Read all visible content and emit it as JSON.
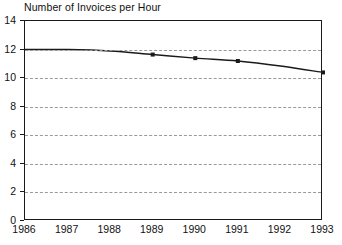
{
  "chart_data": {
    "type": "line",
    "title": "Number of Invoices per Hour",
    "xlabel": "",
    "ylabel": "",
    "categories": [
      "1986",
      "1987",
      "1988",
      "1989",
      "1990",
      "1991",
      "1992",
      "1993"
    ],
    "x": [
      1986,
      1987,
      1988,
      1989,
      1990,
      1991,
      1992,
      1993
    ],
    "values": [
      12.0,
      12.0,
      11.9,
      11.65,
      11.4,
      11.2,
      10.85,
      10.4
    ],
    "series": [
      {
        "name": "Invoices per Hour",
        "values": [
          12.0,
          12.0,
          11.9,
          11.65,
          11.4,
          11.2,
          10.85,
          10.4
        ],
        "color": "#1a1a1a",
        "marker": "square",
        "marker_points": [
          1989,
          1990,
          1991,
          1993
        ]
      }
    ],
    "ylim": [
      0,
      14
    ],
    "yticks": [
      0,
      2,
      4,
      6,
      8,
      10,
      12,
      14
    ],
    "ytick_labels": [
      "0",
      "2",
      "4",
      "6",
      "8",
      "10",
      "12",
      "14"
    ],
    "xlim": [
      1986,
      1993
    ],
    "xticks": [
      1986,
      1987,
      1988,
      1989,
      1990,
      1991,
      1992,
      1993
    ],
    "xtick_labels": [
      "1986",
      "1987",
      "1988",
      "1989",
      "1990",
      "1991",
      "1992",
      "1993"
    ],
    "grid": "horizontal-dashed",
    "grid_color": "#9a9a9a",
    "legend": "none",
    "axis_color": "#1a1a1a",
    "plot_background": "#ffffff"
  }
}
